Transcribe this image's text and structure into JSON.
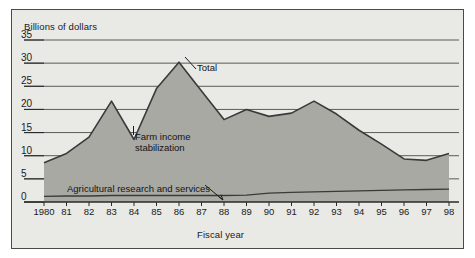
{
  "figure": {
    "y_axis_title": "Billions of dollars",
    "x_axis_title": "Fiscal year",
    "background_color": "#e9e9e6",
    "area_fill_color": "#a9a9a4",
    "line_color": "#3a3a38",
    "gridline_color": "#4a4a48"
  },
  "labels": {
    "total": "Total",
    "farm_income_line1": "Farm income",
    "farm_income_line2": "stabilization",
    "agricultural_research": "Agricultural  research and services"
  },
  "chart_data": {
    "type": "area",
    "title": "",
    "subtitle": "",
    "xlabel": "Fiscal year",
    "ylabel": "Billions of dollars",
    "xlim": [
      1980,
      1998
    ],
    "ylim": [
      0,
      35
    ],
    "yticks": [
      0,
      5,
      10,
      15,
      20,
      25,
      30,
      35
    ],
    "ytick_labels": [
      "0",
      "5",
      "10",
      "15",
      "20",
      "25",
      "30",
      "35"
    ],
    "x": [
      1980,
      1981,
      1982,
      1983,
      1984,
      1985,
      1986,
      1987,
      1988,
      1989,
      1990,
      1991,
      1992,
      1993,
      1994,
      1995,
      1996,
      1997,
      1998
    ],
    "xtick_labels": [
      "1980",
      "81",
      "82",
      "83",
      "84",
      "85",
      "86",
      "87",
      "88",
      "89",
      "90",
      "91",
      "92",
      "93",
      "94",
      "95",
      "96",
      "97",
      "98"
    ],
    "grid": true,
    "grid_axis": "y",
    "legend_position": "inline-annotations",
    "stacked": true,
    "series": [
      {
        "name": "Agricultural  research and services",
        "values": [
          1.2,
          1.3,
          1.3,
          1.4,
          1.4,
          1.4,
          1.4,
          1.4,
          1.4,
          1.5,
          1.9,
          2.1,
          2.2,
          2.3,
          2.4,
          2.5,
          2.6,
          2.7,
          2.8
        ]
      },
      {
        "name": "Farm income stabilization",
        "values": [
          7.3,
          9.2,
          12.7,
          20.4,
          12.1,
          23.1,
          28.8,
          22.6,
          16.4,
          18.5,
          16.6,
          17.1,
          19.6,
          16.7,
          13.1,
          10.0,
          6.7,
          6.3,
          7.7
        ]
      }
    ],
    "total": {
      "name": "Total",
      "values": [
        8.5,
        10.5,
        14.0,
        21.8,
        13.5,
        24.5,
        30.2,
        24.0,
        17.8,
        20.0,
        18.5,
        19.2,
        21.8,
        19.0,
        15.5,
        12.5,
        9.3,
        9.0,
        10.5
      ]
    },
    "annotations": [
      {
        "text": "Total",
        "x": 1987.1,
        "y": 26.5
      },
      {
        "text": "Farm income stabilization",
        "x": 1984.3,
        "y": 11.8
      },
      {
        "text": "Agricultural  research and services",
        "x": 1981.2,
        "y": 2.2
      }
    ]
  }
}
